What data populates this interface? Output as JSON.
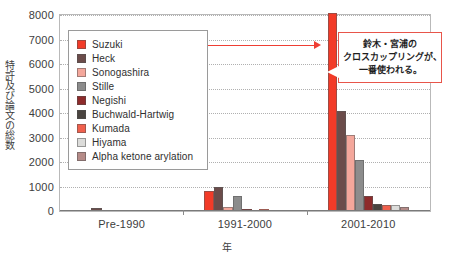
{
  "chart_data": {
    "type": "bar",
    "title": "",
    "xlabel": "年",
    "ylabel": "特許及び論文の総数",
    "ylim": [
      0,
      8000
    ],
    "yticks": [
      0,
      1000,
      2000,
      3000,
      4000,
      5000,
      6000,
      7000,
      8000
    ],
    "grid": true,
    "legend_position": "upper-left-inside",
    "categories": [
      "Pre-1990",
      "1991-2000",
      "2001-2010"
    ],
    "series": [
      {
        "name": "Suzuki",
        "color": "#f23b28",
        "values": [
          50,
          800,
          8100
        ]
      },
      {
        "name": "Heck",
        "color": "#6b4c4a",
        "values": [
          120,
          1000,
          4100
        ]
      },
      {
        "name": "Sonogashira",
        "color": "#f4a79b",
        "values": [
          0,
          150,
          3100
        ]
      },
      {
        "name": "Stille",
        "color": "#8c8c8c",
        "values": [
          0,
          600,
          2100
        ]
      },
      {
        "name": "Negishi",
        "color": "#8e2b2b",
        "values": [
          40,
          70,
          620
        ]
      },
      {
        "name": "Buchwald-Hartwig",
        "color": "#4a4440",
        "values": [
          0,
          0,
          300
        ]
      },
      {
        "name": "Kumada",
        "color": "#f0604d",
        "values": [
          0,
          80,
          250
        ]
      },
      {
        "name": "Hiyama",
        "color": "#dcdcda",
        "values": [
          0,
          40,
          240
        ]
      },
      {
        "name": "Alpha ketone arylation",
        "color": "#b58b88",
        "values": [
          0,
          0,
          180
        ]
      }
    ],
    "annotation": {
      "lines": [
        "鈴木・宮浦の",
        "クロスカップリングが、",
        "一番使われる。"
      ],
      "border_color": "#e8554a",
      "points_to": {
        "series": "Suzuki",
        "category": "2001-2010"
      }
    },
    "arrow": {
      "from": "legend-suzuki",
      "to": "suzuki-2001-2010-bar",
      "color": "#ef3e33"
    }
  }
}
